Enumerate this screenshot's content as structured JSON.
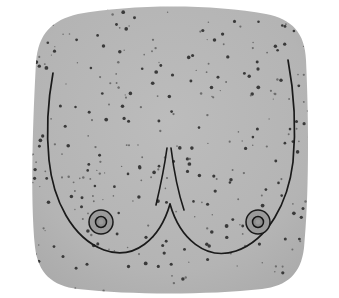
{
  "figure": {
    "style": "stippled line drawing",
    "alt_text": "Grayscale stippled illustration of a female chest showing two breasts with contour lines and areolae"
  },
  "canvas": {
    "width": 339,
    "height": 298,
    "background_color": "#ffffff"
  },
  "colors": {
    "background": "#ffffff",
    "skin_fill": "#b4b4b4",
    "skin_fill_shadow": "#aaaaaa",
    "contour_line": "#1a1a1a",
    "areola_fill": "#9a9a9a",
    "areola_outline": "#1a1a1a",
    "nipple_fill": "#8d8d8d",
    "nipple_outline": "#141414",
    "stipple_dot": "#3a3a3a",
    "stipple_dot_light": "#6e6e6e"
  },
  "shapes": {
    "torso": {
      "name": "torso-silhouette",
      "description": "rounded rectangular chest area filling most of frame",
      "path": "M 36 62 C 38 34 52 20 78 14 C 132 4 214 4 266 14 C 292 19 305 33 306 60 C 309 124 309 198 304 248 C 301 274 287 286 262 289 C 206 295 132 295 78 289 C 52 286 38 273 35 247 C 30 196 33 118 36 62 Z"
    },
    "breast_left_contour": {
      "name": "left-breast-contour",
      "path": "M 53 73 C 48 100 46 130 49 160 C 53 200 72 238 104 250 C 134 261 160 239 170 204"
    },
    "breast_right_contour": {
      "name": "right-breast-contour",
      "path": "M 288 60 C 294 92 296 130 293 162 C 288 203 268 240 236 251 C 206 261 180 239 170 204"
    },
    "cleavage_left": {
      "name": "cleavage-left-line",
      "path": "M 167 148 C 164 170 160 188 156 205"
    },
    "cleavage_right": {
      "name": "cleavage-right-line",
      "path": "M 171 148 C 174 172 178 192 184 210"
    },
    "areola_left": {
      "name": "left-areola",
      "cx": 101,
      "cy": 222,
      "r_outer": 12,
      "r_inner": 5.5,
      "r_center": 2.4
    },
    "areola_right": {
      "name": "right-areola",
      "cx": 258,
      "cy": 222,
      "r_outer": 12,
      "r_inner": 5.5,
      "r_center": 2.4
    }
  },
  "stipple": {
    "name": "skin-stipple-texture",
    "count": 330,
    "min_radius": 0.6,
    "max_radius": 1.9,
    "seed": 20240517
  }
}
